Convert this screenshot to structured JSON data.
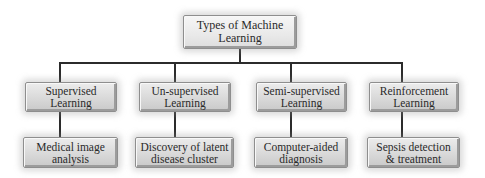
{
  "diagram": {
    "title": "Types of Machine Learning",
    "root": {
      "line1": "Types of Machine",
      "line2": "Learning"
    },
    "categories": [
      {
        "line1": "Supervised",
        "line2": "Learning",
        "example": {
          "line1": "Medical image",
          "line2": "analysis"
        }
      },
      {
        "line1": "Un-supervised",
        "line2": "Learning",
        "example": {
          "line1": "Discovery of latent",
          "line2": "disease cluster"
        }
      },
      {
        "line1": "Semi-supervised",
        "line2": "Learning",
        "example": {
          "line1": "Computer-aided",
          "line2": "diagnosis"
        }
      },
      {
        "line1": "Reinforcement",
        "line2": "Learning",
        "example": {
          "line1": "Sepsis detection",
          "line2": "& treatment"
        }
      }
    ],
    "colors": {
      "box_fill": "#d9d9d9",
      "box_border": "#8e8e8e",
      "connector": "#2b2b2b",
      "text": "#2a2a2a"
    }
  }
}
